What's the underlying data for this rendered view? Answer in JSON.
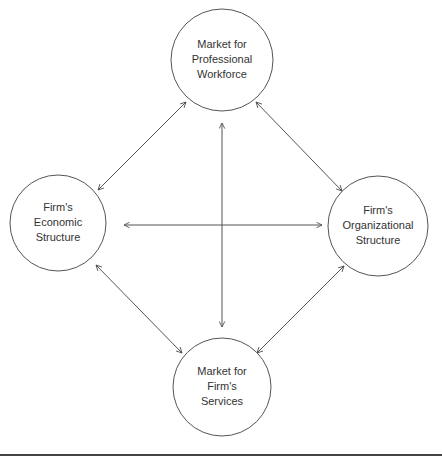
{
  "diagram": {
    "nodes": [
      {
        "id": "workforce",
        "lines": [
          "Market for",
          "Professional",
          "Workforce"
        ],
        "cx": 222,
        "cy": 60,
        "r": 51
      },
      {
        "id": "economic",
        "lines": [
          "Firm's",
          "Economic",
          "Structure"
        ],
        "cx": 58,
        "cy": 223,
        "r": 48
      },
      {
        "id": "organizational",
        "lines": [
          "Firm's",
          "Organizational",
          "Structure"
        ],
        "cx": 378,
        "cy": 226,
        "r": 50
      },
      {
        "id": "services",
        "lines": [
          "Market for",
          "Firm's",
          "Services"
        ],
        "cx": 222,
        "cy": 387,
        "r": 49
      }
    ],
    "edges": [
      {
        "from": "economic",
        "to": "workforce",
        "type": "bidirectional"
      },
      {
        "from": "workforce",
        "to": "organizational",
        "type": "bidirectional"
      },
      {
        "from": "economic",
        "to": "services",
        "type": "bidirectional"
      },
      {
        "from": "organizational",
        "to": "services",
        "type": "bidirectional"
      },
      {
        "from": "workforce",
        "to": "services",
        "type": "bidirectional"
      },
      {
        "from": "economic",
        "to": "organizational",
        "type": "bidirectional"
      }
    ],
    "colors": {
      "stroke": "#555555",
      "text": "#333333",
      "background": "#ffffff"
    }
  }
}
